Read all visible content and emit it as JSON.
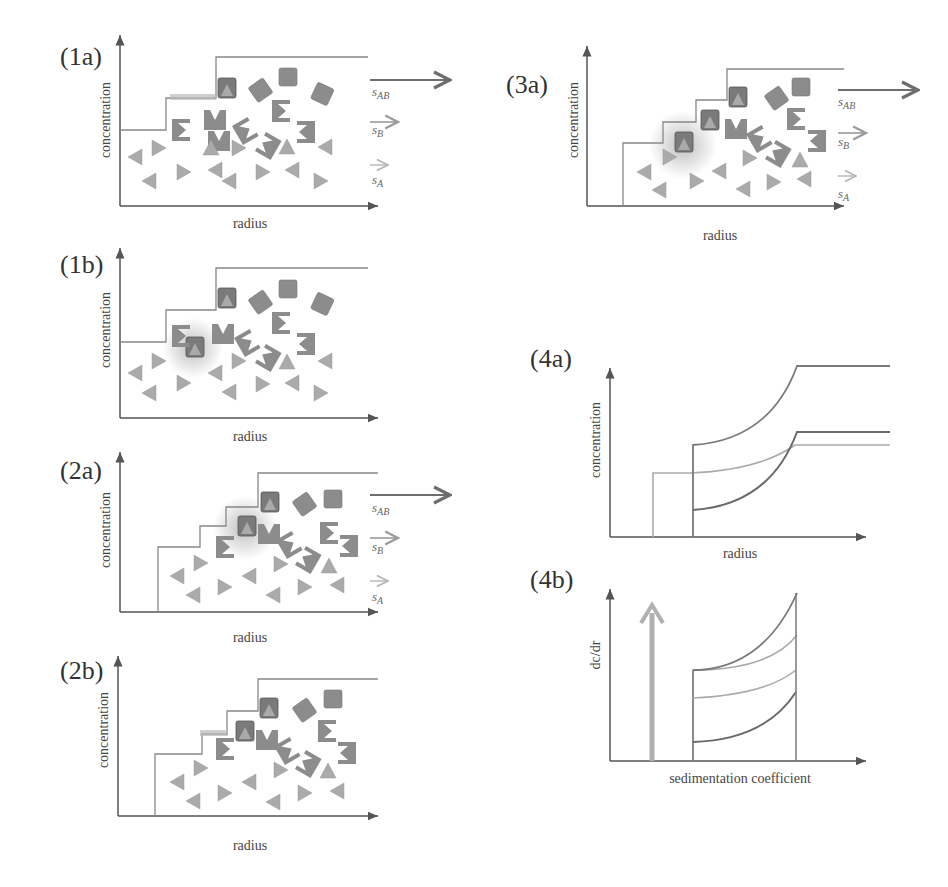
{
  "panels": {
    "p1a": {
      "label": "(1a)",
      "ylabel": "concentration",
      "xlabel": "radius"
    },
    "p1b": {
      "label": "(1b)",
      "ylabel": "concentration",
      "xlabel": "radius"
    },
    "p2a": {
      "label": "(2a)",
      "ylabel": "concentration",
      "xlabel": "radius"
    },
    "p2b": {
      "label": "(2b)",
      "ylabel": "concentration",
      "xlabel": "radius"
    },
    "p3a": {
      "label": "(3a)",
      "ylabel": "concentration",
      "xlabel": "radius"
    },
    "p4a": {
      "label": "(4a)",
      "ylabel": "concentration",
      "xlabel": "radius"
    },
    "p4b": {
      "label": "(4b)",
      "ylabel": "dc/dr",
      "xlabel": "sedimentation coefficient"
    }
  },
  "arrows": {
    "sAB": "s",
    "sAB_sub": "AB",
    "sB": "s",
    "sB_sub": "B",
    "sA": "s",
    "sA_sub": "A"
  },
  "colors": {
    "axis": "#555555",
    "boundary": "#8a8a8a",
    "complex": "#7a7a7a",
    "speciesA": "#aaaaaa",
    "speciesB": "#8c8c8c",
    "arrow_ab": "#6e6e6e",
    "arrow_b": "#9a9a9a",
    "arrow_a": "#b5b5b5"
  }
}
